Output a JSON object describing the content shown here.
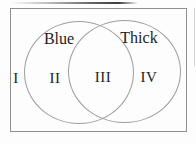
{
  "figure": {
    "type": "venn-diagram",
    "sets": [
      {
        "label": "Blue"
      },
      {
        "label": "Thick"
      }
    ],
    "regions": [
      {
        "label": "I"
      },
      {
        "label": "II"
      },
      {
        "label": "III"
      },
      {
        "label": "IV"
      }
    ],
    "colors": {
      "background": "#fdfdfd",
      "frame_stroke": "#8f8f8f",
      "circle_stroke": "#9e9e9e",
      "text": "#1c1c1c",
      "scan_artifact": "#3d3d3d"
    }
  }
}
